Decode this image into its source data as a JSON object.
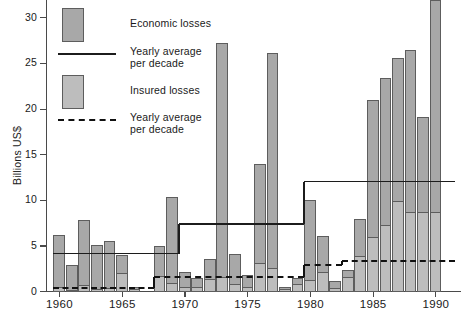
{
  "chart_data": {
    "type": "bar",
    "title": "",
    "subtitle": "",
    "xlabel": "",
    "ylabel": "Billions US$",
    "ylim": [
      0,
      32
    ],
    "xlim": [
      1959.5,
      1992.5
    ],
    "grid": false,
    "stacked": true,
    "legend_position": "top-left",
    "ytick_labels": [
      "0",
      "5",
      "10",
      "15",
      "20",
      "25",
      "30"
    ],
    "ytick_values": [
      0,
      5,
      10,
      15,
      20,
      25,
      30
    ],
    "xtick_labels": [
      "1960",
      "1965",
      "1970",
      "1975",
      "1980",
      "1985",
      "1990"
    ],
    "xtick_values": [
      1960,
      1965,
      1970,
      1975,
      1980,
      1985,
      1990
    ],
    "x": [
      1960,
      1961,
      1962,
      1963,
      1964,
      1965,
      1966,
      1967,
      1968,
      1969,
      1970,
      1971,
      1972,
      1973,
      1974,
      1975,
      1976,
      1977,
      1978,
      1979,
      1980,
      1981,
      1982,
      1983,
      1984,
      1985,
      1986,
      1987,
      1988,
      1989,
      1990,
      1991,
      1992
    ],
    "series": [
      {
        "name": "Economic losses",
        "color": "#a8a8a8",
        "values": [
          6.3,
          3.0,
          7.9,
          5.2,
          5.6,
          4.1,
          0.6,
          0.0,
          5.1,
          10.4,
          2.2,
          1.5,
          3.6,
          27.3,
          4.2,
          1.9,
          14.0,
          26.2,
          0.5,
          1.5,
          10.1,
          6.1,
          1.2,
          2.4,
          8.0,
          21.1,
          23.5,
          25.6,
          26.5,
          19.2,
          32.0,
          0.0,
          0.0
        ]
      },
      {
        "name": "Insured losses",
        "color": "#bdbdbd",
        "values": [
          0.6,
          0.2,
          0.8,
          0.3,
          0.4,
          2.1,
          0.3,
          0.0,
          1.8,
          1.0,
          0.6,
          0.5,
          1.4,
          1.6,
          0.9,
          0.6,
          3.2,
          2.6,
          0.3,
          0.9,
          1.3,
          2.2,
          0.4,
          1.6,
          4.0,
          6.0,
          7.3,
          10.0,
          8.8,
          8.8,
          8.8,
          0.0,
          0.0
        ]
      }
    ],
    "step_lines": [
      {
        "name": "Yearly average per decade",
        "style": "solid",
        "color": "#1c1c1c",
        "segments": [
          {
            "x_start": 1960,
            "x_end": 1970,
            "y": 4.1
          },
          {
            "x_start": 1970,
            "x_end": 1980,
            "y": 7.3
          },
          {
            "x_start": 1980,
            "x_end": 1992,
            "y": 12.0
          }
        ]
      },
      {
        "name": "Yearly average per decade",
        "style": "dashed",
        "color": "#111111",
        "segments": [
          {
            "x_start": 1960,
            "x_end": 1968,
            "y": 0.3
          },
          {
            "x_start": 1968,
            "x_end": 1980,
            "y": 1.5
          },
          {
            "x_start": 1980,
            "x_end": 1983,
            "y": 2.9
          },
          {
            "x_start": 1983,
            "x_end": 1992,
            "y": 3.3
          }
        ]
      }
    ],
    "legend": [
      {
        "marker": "swatch-dark",
        "label": "Economic losses"
      },
      {
        "marker": "line-solid",
        "label": "Yearly average\nper decade",
        "label_line1": "Yearly average",
        "label_line2": "per decade"
      },
      {
        "marker": "swatch-light",
        "label": "Insured losses"
      },
      {
        "marker": "line-dashed",
        "label": "Yearly average\nper decade",
        "label_line1": "Yearly average",
        "label_line2": "per decade"
      }
    ]
  },
  "legend_items": {
    "economic_losses": "Economic losses",
    "insured_losses": "Insured losses",
    "yearly_avg_line1": "Yearly average",
    "yearly_avg_line2": "per decade"
  },
  "axes": {
    "y_title": "Billions US$",
    "y0": "0",
    "y5": "5",
    "y10": "10",
    "y15": "15",
    "y20": "20",
    "y25": "25",
    "y30": "30",
    "x1960": "1960",
    "x1965": "1965",
    "x1970": "1970",
    "x1975": "1975",
    "x1980": "1980",
    "x1985": "1985",
    "x1990": "1990"
  },
  "colors": {
    "economic_fill": "#a8a8a8",
    "insured_fill": "#bdbdbd",
    "bar_stroke": "#5d5d5d",
    "axis": "#4a4a4a",
    "line": "#1c1c1c",
    "background": "#ffffff"
  }
}
